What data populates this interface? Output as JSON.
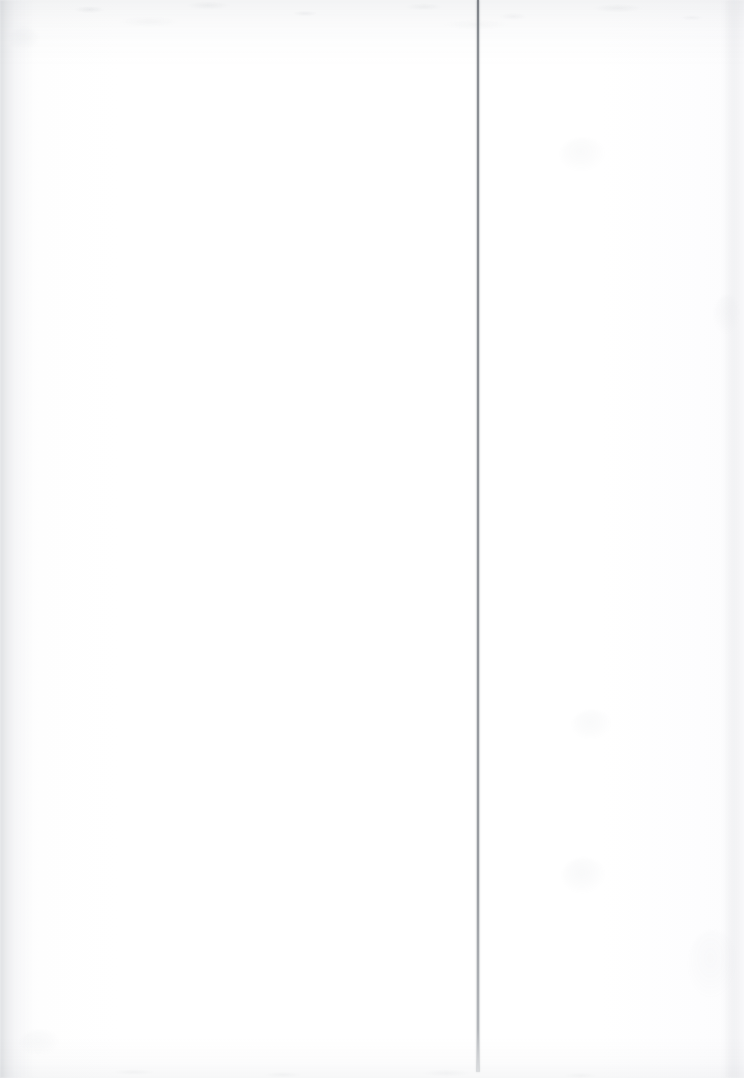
{
  "document": {
    "kind": "scanned-page",
    "title": "Blank Scanned Page",
    "page_width": 744,
    "page_height": 1078,
    "background_color": "#fefefe",
    "visible_text": "",
    "text_blocks": [],
    "notes_label": ""
  },
  "marks": {
    "rule": {
      "name": "vertical-rule",
      "color": "#86898f",
      "x": 477,
      "y": 0,
      "width": 2,
      "height": 1072,
      "orientation": "vertical"
    },
    "edges": {
      "left_shadow_color": "#8c929a",
      "top_grain_color": "#969ba2",
      "bottom_grain_color": "#9298a0",
      "right_streak_color": "#989ea6"
    },
    "stains": [
      {
        "name": "stain-upper-right",
        "x": 560,
        "y": 138,
        "w": 46,
        "h": 34,
        "opacity": 0.05,
        "color": "#9aa0a8"
      },
      {
        "name": "stain-mid-right",
        "x": 714,
        "y": 295,
        "w": 26,
        "h": 40,
        "opacity": 0.05,
        "color": "#9aa0a8"
      },
      {
        "name": "stain-lower-right",
        "x": 572,
        "y": 710,
        "w": 40,
        "h": 30,
        "opacity": 0.05,
        "color": "#9aa0a8"
      },
      {
        "name": "stain-bottom-right",
        "x": 562,
        "y": 858,
        "w": 44,
        "h": 36,
        "opacity": 0.06,
        "color": "#9aa0a8"
      },
      {
        "name": "stain-far-right",
        "x": 688,
        "y": 930,
        "w": 50,
        "h": 70,
        "opacity": 0.04,
        "color": "#9aa0a8"
      },
      {
        "name": "stain-top-left",
        "x": 10,
        "y": 28,
        "w": 30,
        "h": 22,
        "opacity": 0.06,
        "color": "#9aa0a8"
      },
      {
        "name": "stain-bottom-left",
        "x": 20,
        "y": 1030,
        "w": 40,
        "h": 26,
        "opacity": 0.05,
        "color": "#9aa0a8"
      }
    ]
  }
}
